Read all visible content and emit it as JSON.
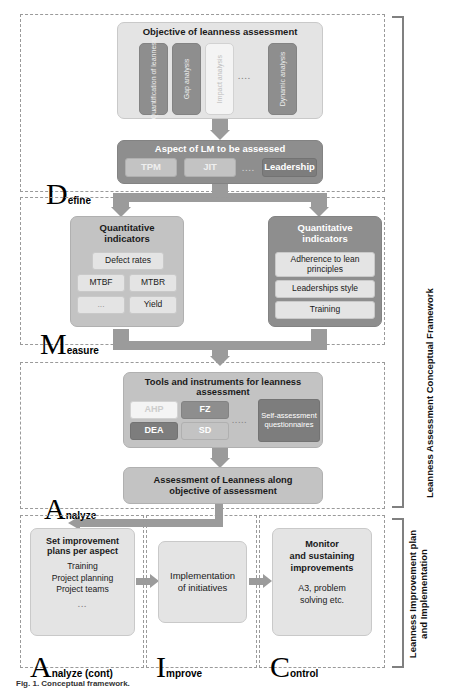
{
  "figure": {
    "caption": "Fig. 1. Conceptual framework."
  },
  "side_labels": {
    "framework": "Leanness Assessment Conceptual Framework",
    "improvement_line1": "Leanness Improvement plan",
    "improvement_line2": "and Implementation"
  },
  "phases": {
    "define": {
      "letter": "D",
      "rest": "efine"
    },
    "measure": {
      "letter": "M",
      "rest": "easure"
    },
    "analyze": {
      "letter": "A",
      "rest": "nalyze"
    },
    "analyze_cont": {
      "letter": "A",
      "rest": "nalyze (cont)"
    },
    "improve": {
      "letter": "I",
      "rest": "mprove"
    },
    "control": {
      "letter": "C",
      "rest": "ontrol"
    }
  },
  "define": {
    "objective_title": "Objective of leanness assessment",
    "objective_items": [
      "Quantification of leanness",
      "Gap analysis",
      "Impact analysis",
      "Dynamic analysis"
    ],
    "objective_ellipsis": "....",
    "aspect_title": "Aspect of LM to be assessed",
    "aspect_items": [
      "TPM",
      "JIT",
      "Leadership"
    ],
    "aspect_ellipsis": "...."
  },
  "measure": {
    "left": {
      "title_line1": "Quantitative",
      "title_line2": "indicators",
      "items": [
        "Defect rates",
        "MTBF",
        "MTBR",
        "...",
        "Yield"
      ]
    },
    "right": {
      "title_line1": "Quantitative",
      "title_line2": "indicators",
      "items": [
        "Adherence to lean principles",
        "Leaderships style",
        "Training"
      ]
    }
  },
  "analyze": {
    "tools_title_line1": "Tools and instruments for leanness",
    "tools_title_line2": "assessment",
    "tools": [
      "AHP",
      "FZ",
      "DEA",
      "SD"
    ],
    "tools_ellipsis": ".....",
    "self_assessment": "Self-assessment questionnaires",
    "assessment_line1": "Assessment of Leanness along",
    "assessment_line2": "objective of assessment"
  },
  "improvement": {
    "plans_title_line1": "Set improvement",
    "plans_title_line2": "plans per aspect",
    "plans_items": [
      "Training",
      "Project planning",
      "Project teams"
    ],
    "plans_ellipsis": "...",
    "implementation_line1": "Implementation",
    "implementation_line2": "of initiatives",
    "monitor_line1": "Monitor",
    "monitor_line2": "and sustaining",
    "monitor_line3": "improvements",
    "monitor_sub_line1": "A3, problem",
    "monitor_sub_line2": "solving etc."
  },
  "colors": {
    "light_gray": "#e4e4e4",
    "mid_gray": "#c3c3c3",
    "dark_gray": "#8e8e8e",
    "arrow_gray": "#9b9b9b",
    "frame_dash": "#9a9a9a"
  }
}
